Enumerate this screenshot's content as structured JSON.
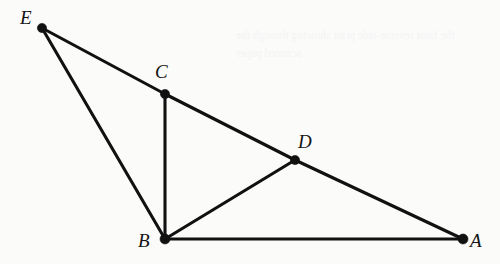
{
  "figure": {
    "caption": "",
    "background_color": "#fbfbfa",
    "ink_color": "#111111",
    "width": 500,
    "height": 264,
    "vertices": [
      {
        "id": "E",
        "label": "E",
        "x": 42,
        "y": 28,
        "label_x": 20,
        "label_y": 8,
        "dot_radius": 4.6
      },
      {
        "id": "C",
        "label": "C",
        "x": 165,
        "y": 94,
        "label_x": 155,
        "label_y": 62,
        "dot_radius": 4.6
      },
      {
        "id": "D",
        "label": "D",
        "x": 295,
        "y": 160,
        "label_x": 298,
        "label_y": 132,
        "dot_radius": 4.6
      },
      {
        "id": "B",
        "label": "B",
        "x": 165,
        "y": 239,
        "label_x": 138,
        "label_y": 231,
        "dot_radius": 5.0
      },
      {
        "id": "A",
        "label": "A",
        "x": 463,
        "y": 239,
        "label_x": 470,
        "label_y": 231,
        "dot_radius": 5.0
      }
    ],
    "edges": [
      {
        "id": "E-C",
        "from": "E",
        "to": "C"
      },
      {
        "id": "C-D",
        "from": "C",
        "to": "D"
      },
      {
        "id": "D-A",
        "from": "D",
        "to": "A"
      },
      {
        "id": "E-B",
        "from": "E",
        "to": "B"
      },
      {
        "id": "C-B",
        "from": "C",
        "to": "B"
      },
      {
        "id": "B-D",
        "from": "B",
        "to": "D"
      },
      {
        "id": "B-A",
        "from": "B",
        "to": "A"
      }
    ],
    "bleed_through_text": "the faint reverse-side print\nshowing through the scanned paper"
  }
}
